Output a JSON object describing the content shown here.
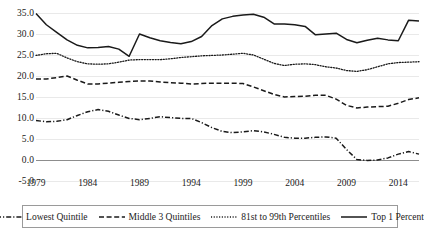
{
  "chart_data": {
    "type": "line",
    "title": "",
    "xlabel": "",
    "ylabel": "",
    "xlim": [
      1979,
      2016
    ],
    "ylim": [
      -5.0,
      35.0
    ],
    "grid": true,
    "legend_position": "bottom",
    "y_ticks": [
      "35.0",
      "30.0",
      "25.0",
      "20.0",
      "15.0",
      "10.0",
      "5.0",
      "0.0",
      "-5.0"
    ],
    "y_tick_values": [
      35.0,
      30.0,
      25.0,
      20.0,
      15.0,
      10.0,
      5.0,
      0.0,
      -5.0
    ],
    "x_ticks": [
      "1979",
      "1984",
      "1989",
      "1994",
      "1999",
      "2004",
      "2009",
      "2014"
    ],
    "x_tick_values": [
      1979,
      1984,
      1989,
      1994,
      1999,
      2004,
      2009,
      2014
    ],
    "x": [
      1979,
      1980,
      1981,
      1982,
      1983,
      1984,
      1985,
      1986,
      1987,
      1988,
      1989,
      1990,
      1991,
      1992,
      1993,
      1994,
      1995,
      1996,
      1997,
      1998,
      1999,
      2000,
      2001,
      2002,
      2003,
      2004,
      2005,
      2006,
      2007,
      2008,
      2009,
      2010,
      2011,
      2012,
      2013,
      2014,
      2015,
      2016
    ],
    "series": [
      {
        "name": "Lowest Quintile",
        "style": "dashdot",
        "color": "#1a1a1a",
        "values": [
          9.4,
          9.1,
          9.2,
          9.6,
          10.6,
          11.5,
          12.0,
          11.6,
          10.7,
          9.9,
          9.6,
          9.9,
          10.3,
          10.1,
          9.9,
          9.9,
          8.9,
          7.7,
          6.8,
          6.5,
          6.7,
          7.0,
          6.7,
          6.1,
          5.4,
          5.2,
          5.2,
          5.4,
          5.5,
          5.2,
          2.5,
          0.1,
          -0.1,
          0.0,
          0.5,
          1.4,
          2.0,
          1.4
        ]
      },
      {
        "name": "Middle 3 Quintiles",
        "style": "dashed",
        "color": "#1a1a1a",
        "values": [
          19.3,
          19.3,
          19.6,
          20.0,
          19.0,
          18.1,
          18.1,
          18.3,
          18.5,
          18.7,
          18.8,
          18.8,
          18.6,
          18.4,
          18.3,
          18.1,
          18.2,
          18.3,
          18.3,
          18.3,
          18.2,
          17.4,
          16.5,
          15.6,
          15.0,
          15.1,
          15.2,
          15.4,
          15.4,
          14.5,
          13.0,
          12.4,
          12.6,
          12.7,
          12.8,
          13.5,
          14.4,
          14.8
        ]
      },
      {
        "name": "81st to 99th Percentiles",
        "style": "dotted",
        "color": "#1a1a1a",
        "values": [
          24.9,
          25.3,
          25.4,
          24.3,
          23.4,
          22.9,
          22.8,
          22.9,
          23.3,
          23.8,
          23.9,
          23.9,
          23.9,
          24.1,
          24.4,
          24.6,
          24.8,
          24.9,
          25.0,
          25.2,
          25.4,
          25.0,
          24.0,
          23.0,
          22.5,
          22.8,
          22.9,
          22.7,
          22.2,
          21.9,
          21.3,
          21.1,
          21.5,
          22.2,
          22.9,
          23.2,
          23.3,
          23.4
        ]
      },
      {
        "name": "Top 1 Percent",
        "style": "solid",
        "color": "#1a1a1a",
        "values": [
          34.9,
          32.2,
          30.4,
          28.6,
          27.3,
          26.7,
          26.8,
          27.0,
          26.4,
          24.7,
          30.0,
          29.1,
          28.4,
          28.0,
          27.7,
          28.2,
          29.4,
          32.0,
          33.6,
          34.2,
          34.5,
          34.7,
          34.0,
          32.4,
          32.4,
          32.2,
          31.8,
          29.8,
          30.0,
          30.2,
          28.7,
          27.9,
          28.5,
          29.0,
          28.6,
          28.4,
          33.3,
          33.1
        ]
      }
    ]
  },
  "legend": {
    "items": [
      {
        "label": "Lowest Quintile",
        "style": "dashdot"
      },
      {
        "label": "Middle 3 Quintiles",
        "style": "dashed"
      },
      {
        "label": "81st to 99th Percentiles",
        "style": "dotted"
      },
      {
        "label": "Top 1 Percent",
        "style": "solid"
      }
    ]
  }
}
